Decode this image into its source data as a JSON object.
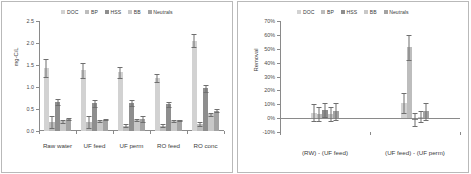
{
  "series_names": [
    "DOC",
    "BP",
    "HSS",
    "BB",
    "Neutrals"
  ],
  "colors": {
    "DOC": "#d2d2d2",
    "BP": "#bdbdbd",
    "HSS": "#8e8e8e",
    "BB": "#c8c8c8",
    "Neutrals": "#a3a3a3",
    "error_bar": "#6f6f6f",
    "axis": "#8a8a8a",
    "text": "#3c3c3c",
    "border": "#b9b9b9"
  },
  "chart_data": [
    {
      "type": "bar",
      "id": "concentrations",
      "title": "",
      "xlabel": "",
      "ylabel": "mg-C/L",
      "ylim": [
        0,
        2.5
      ],
      "ytick_step": 0.5,
      "yticks": [
        "0.0",
        "0.5",
        "1.0",
        "1.5",
        "2.0",
        "2.5"
      ],
      "grid": false,
      "legend_position": "top-center",
      "categories": [
        "Raw water",
        "UF feed",
        "UF perm",
        "RO feed",
        "RO conc"
      ],
      "series": [
        {
          "name": "DOC",
          "values": [
            1.43,
            1.38,
            1.33,
            1.2,
            2.05
          ],
          "errors": [
            0.21,
            0.17,
            0.12,
            0.09,
            0.15
          ]
        },
        {
          "name": "BP",
          "values": [
            0.21,
            0.21,
            0.12,
            0.12,
            0.16
          ],
          "errors": [
            0.14,
            0.14,
            0.03,
            0.03,
            0.05
          ]
        },
        {
          "name": "HSS",
          "values": [
            0.65,
            0.63,
            0.63,
            0.61,
            0.97
          ],
          "errors": [
            0.07,
            0.08,
            0.07,
            0.06,
            0.08
          ]
        },
        {
          "name": "BB",
          "values": [
            0.22,
            0.23,
            0.25,
            0.22,
            0.38
          ],
          "errors": [
            0.04,
            0.03,
            0.03,
            0.02,
            0.04
          ]
        },
        {
          "name": "Neutrals",
          "values": [
            0.27,
            0.26,
            0.27,
            0.24,
            0.46
          ],
          "errors": [
            0.03,
            0.02,
            0.06,
            0.02,
            0.03
          ]
        }
      ]
    },
    {
      "type": "bar",
      "id": "removal",
      "title": "",
      "xlabel": "",
      "ylabel": "Removal",
      "ylim": [
        -10,
        70
      ],
      "ytick_step": 10,
      "yticks": [
        "-10%",
        "0%",
        "10%",
        "20%",
        "30%",
        "40%",
        "50%",
        "60%",
        "70%"
      ],
      "grid": false,
      "legend_position": "top-center",
      "categories": [
        "(RW) - (UF feed)",
        "(UF feed) - (UF perm)"
      ],
      "series": [
        {
          "name": "DOC",
          "values": [
            4,
            11
          ],
          "errors": [
            6,
            7
          ]
        },
        {
          "name": "BP",
          "values": [
            3,
            51
          ],
          "errors": [
            5,
            9
          ]
        },
        {
          "name": "HSS",
          "values": [
            6,
            -1
          ],
          "errors": [
            5,
            5
          ]
        },
        {
          "name": "BB",
          "values": [
            3,
            1
          ],
          "errors": [
            5,
            4
          ]
        },
        {
          "name": "Neutrals",
          "values": [
            5,
            5
          ],
          "errors": [
            6,
            6
          ]
        }
      ]
    }
  ]
}
